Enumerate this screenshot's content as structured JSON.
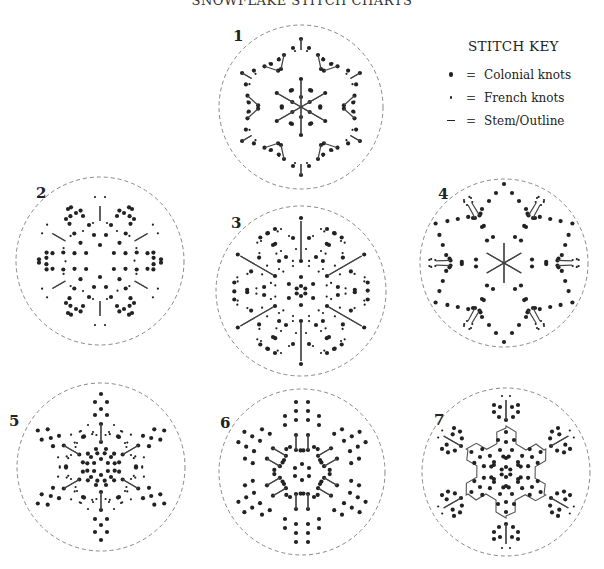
{
  "title": "SNOWFLAKE STITCH CHARTS",
  "stitch_key": {
    "title": "STITCH KEY",
    "items": [
      {
        "symbol": "large-dot",
        "equals": "=",
        "label": "Colonial knots"
      },
      {
        "symbol": "small-dot",
        "equals": "=",
        "label": "French knots"
      },
      {
        "symbol": "dash",
        "equals": "=",
        "label": "Stem/Outline"
      }
    ]
  },
  "colors": {
    "ink": "#222222",
    "circle": "#888888",
    "background": "#ffffff"
  },
  "charts": [
    {
      "number": "1",
      "cx": 301,
      "cy": 107,
      "r": 82,
      "label_x": 233,
      "label_y": 30,
      "rot": 0,
      "pattern": {
        "colonial": [
          [
            0,
            -68
          ],
          [
            -8,
            -59
          ],
          [
            8,
            -59
          ],
          [
            -17,
            -52
          ],
          [
            17,
            -52
          ],
          [
            0,
            -28
          ],
          [
            -9,
            -17
          ],
          [
            9,
            -17
          ],
          [
            -20,
            -38
          ],
          [
            20,
            -38
          ],
          [
            -30,
            -43
          ],
          [
            0,
            -10
          ]
        ],
        "french": [
          [
            -6,
            -56
          ],
          [
            6,
            -56
          ],
          [
            -22,
            -49
          ],
          [
            22,
            -49
          ]
        ],
        "stem": [
          [
            [
              0,
              -68
            ],
            [
              0,
              -57
            ]
          ],
          [
            [
              -17,
              -52
            ],
            [
              -20,
              -38
            ]
          ],
          [
            [
              0,
              -26
            ],
            [
              0,
              0
            ]
          ]
        ]
      }
    },
    {
      "number": "2",
      "cx": 100,
      "cy": 261,
      "r": 84,
      "label_x": 36,
      "label_y": 187,
      "rot": 0,
      "pattern": {
        "colonial": [
          [
            0,
            -16
          ],
          [
            -6,
            -26
          ],
          [
            6,
            -26
          ],
          [
            -11,
            -36
          ],
          [
            11,
            -36
          ],
          [
            -17,
            -45
          ],
          [
            17,
            -45
          ],
          [
            -32,
            -52
          ],
          [
            -34,
            -42
          ],
          [
            -24,
            -48
          ]
        ],
        "french": [
          [
            -5,
            -64
          ],
          [
            5,
            -64
          ],
          [
            -7,
            -38
          ],
          [
            7,
            -38
          ],
          [
            -17,
            -30
          ]
        ],
        "stem": [
          [
            [
              0,
              -55
            ],
            [
              0,
              -40
            ]
          ]
        ]
      }
    },
    {
      "number": "3",
      "cx": 301,
      "cy": 291,
      "r": 85,
      "label_x": 231,
      "label_y": 217,
      "rot": 0,
      "pattern": {
        "colonial": [
          [
            0,
            -73
          ],
          [
            0,
            -30
          ],
          [
            0,
            -14
          ],
          [
            -8,
            -53
          ],
          [
            8,
            -53
          ],
          [
            -28,
            -46
          ],
          [
            -33,
            -58
          ],
          [
            -26,
            -62
          ],
          [
            -15,
            -34
          ],
          [
            0,
            -5
          ]
        ],
        "french": [
          [
            -12,
            -55
          ],
          [
            12,
            -55
          ],
          [
            -20,
            -40
          ],
          [
            -40,
            -50
          ],
          [
            -20,
            -62
          ],
          [
            -8,
            -25
          ],
          [
            -5,
            -42
          ],
          [
            -22,
            -22
          ]
        ],
        "stem": [
          [
            [
              0,
              -70
            ],
            [
              0,
              -32
            ]
          ]
        ]
      }
    },
    {
      "number": "4",
      "cx": 504,
      "cy": 263,
      "r": 84,
      "label_x": 438,
      "label_y": 188,
      "rot": 0,
      "pattern": {
        "colonial": [
          [
            0,
            -79
          ],
          [
            -8,
            -70
          ],
          [
            8,
            -70
          ],
          [
            -15,
            -62
          ],
          [
            15,
            -62
          ],
          [
            -22,
            -54
          ],
          [
            22,
            -54
          ],
          [
            -22,
            -36
          ],
          [
            -11,
            -26
          ],
          [
            11,
            -26
          ],
          [
            -31,
            -45
          ],
          [
            -29,
            -45
          ]
        ],
        "french": [
          [
            -40,
            -63
          ],
          [
            -33,
            -65
          ],
          [
            -37,
            -58
          ]
        ],
        "stem": [
          [
            [
              0,
              0
            ],
            [
              0,
              -20
            ]
          ],
          [
            [
              -29,
              -45
            ],
            [
              -36,
              -58
            ]
          ]
        ]
      }
    },
    {
      "number": "5",
      "cx": 101,
      "cy": 467,
      "r": 84,
      "label_x": 9,
      "label_y": 415,
      "rot": 0,
      "pattern": {
        "colonial": [
          [
            0,
            -73
          ],
          [
            -6,
            -65
          ],
          [
            6,
            -65
          ],
          [
            0,
            -58
          ],
          [
            -6,
            -52
          ],
          [
            6,
            -52
          ],
          [
            0,
            -43
          ],
          [
            0,
            -25
          ],
          [
            -5,
            -18
          ],
          [
            5,
            -18
          ],
          [
            0,
            -8
          ],
          [
            -10,
            -10
          ],
          [
            -18,
            -30
          ]
        ],
        "french": [
          [
            -13,
            -42
          ],
          [
            13,
            -42
          ],
          [
            -20,
            -36
          ],
          [
            -8,
            -35
          ],
          [
            -24,
            -24
          ],
          [
            -30,
            -12
          ]
        ],
        "stem": [
          [
            [
              0,
              -43
            ],
            [
              0,
              -25
            ]
          ]
        ]
      }
    },
    {
      "number": "6",
      "cx": 302,
      "cy": 472,
      "r": 83,
      "label_x": 220,
      "label_y": 417,
      "rot": 0,
      "pattern": {
        "colonial": [
          [
            -6,
            -70
          ],
          [
            6,
            -70
          ],
          [
            -6,
            -61
          ],
          [
            6,
            -61
          ],
          [
            -6,
            -52
          ],
          [
            6,
            -52
          ],
          [
            -17,
            -56
          ],
          [
            17,
            -56
          ],
          [
            -17,
            -47
          ],
          [
            17,
            -47
          ],
          [
            -6,
            -37
          ],
          [
            6,
            -37
          ],
          [
            -6,
            -22
          ],
          [
            6,
            -22
          ],
          [
            -12,
            -25
          ],
          [
            -18,
            -12
          ],
          [
            0,
            -8
          ],
          [
            -7,
            -4
          ]
        ],
        "french": [],
        "stem": [
          [
            [
              -6,
              -37
            ],
            [
              -6,
              -22
            ]
          ],
          [
            [
              6,
              -37
            ],
            [
              6,
              -22
            ]
          ]
        ]
      }
    },
    {
      "number": "7",
      "cx": 506,
      "cy": 472,
      "r": 84,
      "label_x": 434,
      "label_y": 414,
      "rot": 0,
      "pattern": {
        "colonial": [
          [
            0,
            -52
          ],
          [
            0,
            -40
          ],
          [
            -12,
            -60
          ],
          [
            12,
            -60
          ],
          [
            -12,
            -67
          ],
          [
            12,
            -67
          ],
          [
            -7,
            -55
          ],
          [
            7,
            -55
          ],
          [
            -6,
            -65
          ],
          [
            6,
            -65
          ],
          [
            0,
            -30
          ],
          [
            -6,
            -22
          ],
          [
            6,
            -22
          ],
          [
            0,
            -14
          ],
          [
            -12,
            -10
          ],
          [
            0,
            -5
          ],
          [
            -8,
            -32
          ],
          [
            8,
            -32
          ]
        ],
        "french": [
          [
            -4,
            -76
          ],
          [
            4,
            -76
          ]
        ],
        "stem": [
          [
            [
              0,
              -72
            ],
            [
              0,
              -52
            ]
          ]
        ],
        "outline": true
      }
    }
  ]
}
